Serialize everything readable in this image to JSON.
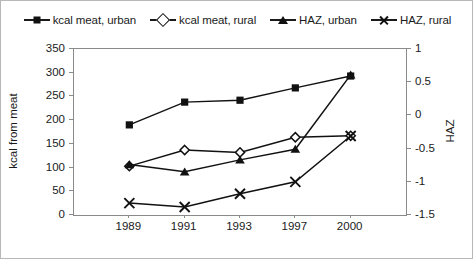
{
  "chart_data": {
    "type": "line",
    "title": "",
    "xlabel": "",
    "ylabel": "kcal from meat",
    "y2label": "HAZ",
    "categories": [
      "1989",
      "1991",
      "1993",
      "1997",
      "2000"
    ],
    "ylim": [
      0,
      350
    ],
    "yticks": [
      0,
      50,
      100,
      150,
      200,
      250,
      300,
      350
    ],
    "ytick_labels": [
      "0",
      "50",
      "100",
      "150",
      "200",
      "250",
      "300",
      "350"
    ],
    "y2lim": [
      -1.5,
      1
    ],
    "y2ticks": [
      -1.5,
      -1,
      -0.5,
      0,
      0.5,
      1
    ],
    "y2tick_labels": [
      "-1.5",
      "-1",
      "-0.5",
      "0",
      "0.5",
      "1"
    ],
    "grid": false,
    "legend_position": "top",
    "series": [
      {
        "name": "kcal meat, urban",
        "axis": "left",
        "marker": "filled-square",
        "values": [
          190,
          238,
          242,
          268,
          293
        ]
      },
      {
        "name": "kcal meat, rural",
        "axis": "left",
        "marker": "open-diamond",
        "values": [
          103,
          137,
          132,
          164,
          167
        ]
      },
      {
        "name": "HAZ, urban",
        "axis": "right",
        "marker": "filled-triangle",
        "values": [
          -0.74,
          -0.85,
          -0.67,
          -0.51,
          0.61
        ]
      },
      {
        "name": "HAZ, rural",
        "axis": "right",
        "marker": "cross-x",
        "values": [
          -1.32,
          -1.38,
          -1.18,
          -1.0,
          -0.31
        ]
      }
    ]
  },
  "colors": {
    "line": "#111111",
    "axis": "#8a8a8a",
    "text": "#1a1a1a",
    "background": "#ffffff"
  }
}
